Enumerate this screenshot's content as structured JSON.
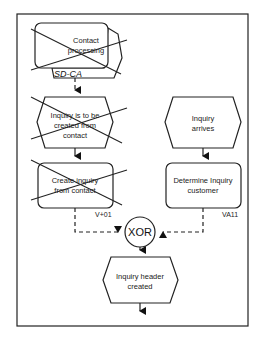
{
  "diagram": {
    "type": "EPC process chain",
    "colors": {
      "stroke": "#222222",
      "background": "#ffffff"
    },
    "nodes": [
      {
        "id": "process-interface",
        "kind": "process-interface",
        "lines": [
          "Contact",
          "processing"
        ],
        "tag": "SD-CA",
        "crossed_out": true
      },
      {
        "id": "event-inquiry-to-be-created",
        "kind": "event",
        "lines": [
          "Inquiry is to be",
          "created from",
          "contact"
        ],
        "crossed_out": true
      },
      {
        "id": "function-create-inquiry",
        "kind": "function",
        "lines": [
          "Create inquiry",
          "from contact"
        ],
        "code": "V+01",
        "crossed_out": true
      },
      {
        "id": "event-inquiry-arrives",
        "kind": "event",
        "lines": [
          "Inquiry",
          "arrives"
        ],
        "crossed_out": false
      },
      {
        "id": "function-determine-customer",
        "kind": "function",
        "lines": [
          "Determine Inquiry",
          "customer"
        ],
        "code": "VA11",
        "crossed_out": false
      },
      {
        "id": "connector-xor",
        "kind": "connector",
        "label": "XOR"
      },
      {
        "id": "event-inquiry-header-created",
        "kind": "event",
        "lines": [
          "Inquiry header",
          "created"
        ],
        "crossed_out": false
      }
    ],
    "edges": [
      {
        "from": "process-interface",
        "to": "event-inquiry-to-be-created",
        "style": "dashed"
      },
      {
        "from": "event-inquiry-to-be-created",
        "to": "function-create-inquiry",
        "style": "solid"
      },
      {
        "from": "event-inquiry-arrives",
        "to": "function-determine-customer",
        "style": "solid"
      },
      {
        "from": "function-create-inquiry",
        "to": "connector-xor",
        "style": "dashed"
      },
      {
        "from": "function-determine-customer",
        "to": "connector-xor",
        "style": "dashed"
      },
      {
        "from": "connector-xor",
        "to": "event-inquiry-header-created",
        "style": "solid"
      },
      {
        "from": "event-inquiry-header-created",
        "to": "continuation",
        "style": "solid"
      }
    ]
  },
  "labels": {
    "pi_line1": "Contact",
    "pi_line2": "processing",
    "pi_tag": "SD-CA",
    "ev1_line1": "Inquiry is to be",
    "ev1_line2": "created from",
    "ev1_line3": "contact",
    "fn1_line1": "Create inquiry",
    "fn1_line2": "from contact",
    "fn1_code": "V+01",
    "ev2_line1": "Inquiry",
    "ev2_line2": "arrives",
    "fn2_line1": "Determine Inquiry",
    "fn2_line2": "customer",
    "fn2_code": "VA11",
    "xor": "XOR",
    "ev3_line1": "Inquiry header",
    "ev3_line2": "created"
  }
}
